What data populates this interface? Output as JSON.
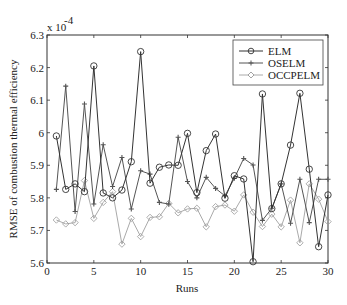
{
  "chart_data": {
    "type": "line",
    "title": "",
    "xlabel": "Runs",
    "ylabel": "RMSE of combustion thermal efficiency",
    "y_multiplier": "x 10",
    "y_multiplier_exponent": "-4",
    "xlim": [
      0,
      30
    ],
    "ylim": [
      5.6,
      6.3
    ],
    "xticks": [
      0,
      5,
      10,
      15,
      20,
      25,
      30
    ],
    "yticks": [
      5.6,
      5.7,
      5.8,
      5.9,
      6,
      6.1,
      6.2,
      6.3
    ],
    "ytick_labels": [
      "5.6",
      "5.7",
      "5.8",
      "5.9",
      "6",
      "6.1",
      "6.2",
      "6.3"
    ],
    "grid": false,
    "legend_position": "upper right",
    "x": [
      1,
      2,
      3,
      4,
      5,
      6,
      7,
      8,
      9,
      10,
      11,
      12,
      13,
      14,
      15,
      16,
      17,
      18,
      19,
      20,
      21,
      22,
      23,
      24,
      25,
      26,
      27,
      28,
      29,
      30
    ],
    "series": [
      {
        "name": "ELM",
        "marker": "circle",
        "color": "#333333",
        "values": [
          5.99,
          5.826,
          5.843,
          5.819,
          6.205,
          5.815,
          5.8,
          5.824,
          5.911,
          6.249,
          5.845,
          5.894,
          5.901,
          5.9,
          5.998,
          5.816,
          5.945,
          5.996,
          5.799,
          5.868,
          5.858,
          5.604,
          6.119,
          5.767,
          5.843,
          5.962,
          6.121,
          5.888,
          5.65,
          5.809
        ]
      },
      {
        "name": "OSELM",
        "marker": "plus",
        "color": "#555555",
        "values": [
          5.826,
          6.143,
          5.758,
          6.088,
          5.781,
          5.963,
          5.835,
          5.924,
          5.766,
          5.883,
          5.873,
          5.786,
          5.781,
          5.986,
          5.85,
          5.8,
          5.863,
          5.829,
          5.806,
          5.86,
          5.921,
          5.901,
          5.731,
          5.768,
          5.843,
          5.722,
          5.857,
          5.724,
          5.857,
          5.857
        ]
      },
      {
        "name": "OCCPELM",
        "marker": "diamond",
        "color": "#aaaaaa",
        "values": [
          5.732,
          5.72,
          5.724,
          5.853,
          5.737,
          5.786,
          5.819,
          5.658,
          5.737,
          5.681,
          5.74,
          5.742,
          5.783,
          5.754,
          5.766,
          5.768,
          5.711,
          5.773,
          5.778,
          5.759,
          5.809,
          5.756,
          5.712,
          5.75,
          5.711,
          5.793,
          5.662,
          5.843,
          5.796,
          5.727
        ]
      }
    ]
  },
  "legend": {
    "items": [
      "ELM",
      "OSELM",
      "OCCPELM"
    ]
  }
}
